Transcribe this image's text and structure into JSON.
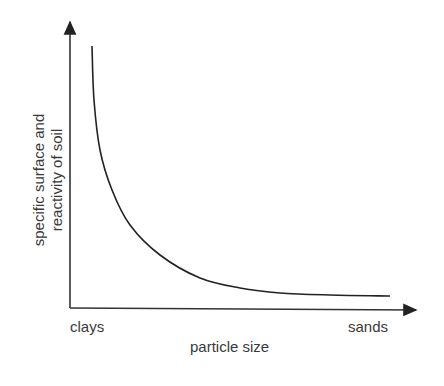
{
  "chart_data": {
    "type": "line",
    "title": "",
    "xlabel": "particle size",
    "ylabel": "specific surface and reactivity of soil",
    "ylabel_lines": [
      "specific surface and",
      "reactivity of soil"
    ],
    "x_tick_labels": {
      "left": "clays",
      "right": "sands"
    },
    "grid": false,
    "legend": null,
    "series": [
      {
        "name": "specific surface vs particle size",
        "description": "qualitative decreasing hyperbolic curve",
        "points_px": [
          [
            92,
            46
          ],
          [
            94,
            100
          ],
          [
            100,
            150
          ],
          [
            112,
            190
          ],
          [
            130,
            225
          ],
          [
            160,
            255
          ],
          [
            200,
            278
          ],
          [
            240,
            288
          ],
          [
            280,
            293
          ],
          [
            330,
            295
          ],
          [
            390,
            296
          ]
        ]
      }
    ],
    "colors": {
      "curve": "#222222",
      "axes": "#333333"
    }
  }
}
